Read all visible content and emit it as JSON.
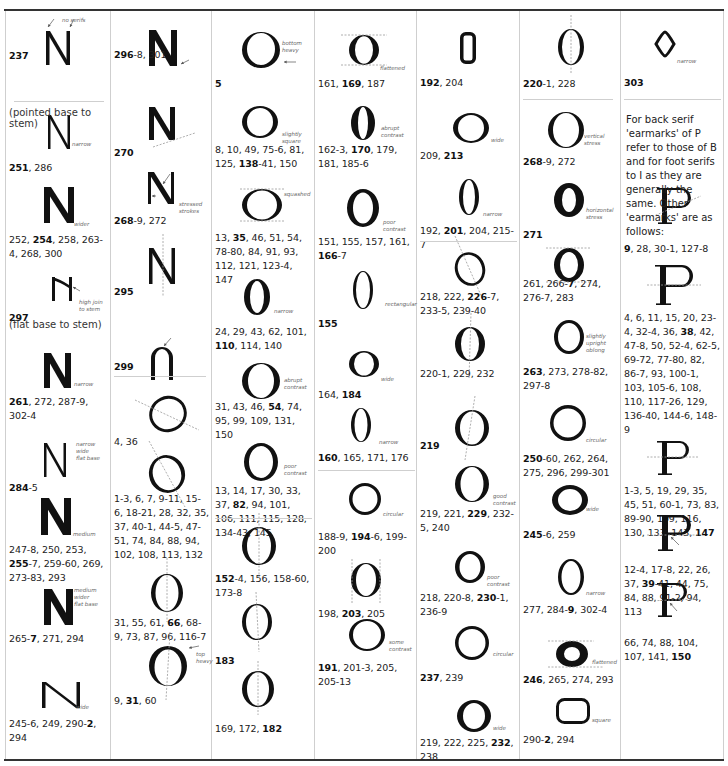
{
  "page": {
    "subheadings": {
      "pointed_base": "(pointed base to stem)",
      "flat_base": "(flat base to stem)"
    },
    "paragraph": "For back serif 'earmarks' of P refer to those of B and for foot serifs to I as they are generally the same. Other 'earmarks' are as follows:"
  },
  "columns": [
    {
      "id": "col1",
      "letter": "N",
      "entries": [
        {
          "glyph": "N-no-serifs",
          "notes": [
            "no serifs"
          ],
          "ref": [
            {
              "b": "237"
            }
          ]
        },
        {
          "glyph": "N-narrow",
          "notes": [
            "narrow"
          ],
          "ref": [
            {
              "b": "251"
            },
            {
              "t": ", 286"
            }
          ]
        },
        {
          "glyph": "N-wider",
          "notes": [
            "wider"
          ],
          "ref": [
            {
              "t": "252, "
            },
            {
              "b": "254"
            },
            {
              "t": ", 258, 263-4, 268, 300"
            }
          ]
        },
        {
          "glyph": "N-high-join",
          "notes": [
            "high join",
            "to stem"
          ],
          "ref": [
            {
              "b": "297"
            }
          ]
        },
        {
          "glyph": "N-narrow-bold",
          "notes": [
            "narrow"
          ],
          "ref": [
            {
              "b": "261"
            },
            {
              "t": ", 272, 287-9, 302-4"
            }
          ]
        },
        {
          "glyph": "N-narrow-wide-flat",
          "notes": [
            "narrow",
            "wide",
            "flat base"
          ],
          "ref": [
            {
              "b": "284"
            },
            {
              "t": "-5"
            }
          ]
        },
        {
          "glyph": "N-medium",
          "notes": [
            "medium"
          ],
          "ref": [
            {
              "t": "247-8, 250, 253, "
            },
            {
              "b": "255"
            },
            {
              "t": "-7, 259-60, 269, 273-83, 293"
            }
          ]
        },
        {
          "glyph": "N-medium-wider-flat",
          "notes": [
            "medium",
            "wider",
            "flat base"
          ],
          "ref": [
            {
              "t": "265-"
            },
            {
              "b": "7"
            },
            {
              "t": ", 271, 294"
            }
          ]
        },
        {
          "glyph": "N-wide",
          "notes": [
            "wide"
          ],
          "ref": [
            {
              "t": "245-6, 249, 290-"
            },
            {
              "b": "2"
            },
            {
              "t": ", 294"
            }
          ]
        }
      ]
    },
    {
      "id": "col2",
      "letter": "N / O",
      "entries": [
        {
          "glyph": "N-heavy-arrow",
          "notes": [],
          "ref": [
            {
              "b": "296"
            },
            {
              "t": "-8, 301"
            }
          ]
        },
        {
          "glyph": "N-base-line",
          "notes": [],
          "ref": [
            {
              "b": "270"
            }
          ]
        },
        {
          "glyph": "N-stressed",
          "notes": [
            "stressed",
            "strokes"
          ],
          "ref": [
            {
              "b": "268"
            },
            {
              "t": "-9, 272"
            }
          ]
        },
        {
          "glyph": "N-axis",
          "notes": [],
          "ref": [
            {
              "b": "295"
            }
          ]
        },
        {
          "glyph": "N-arch",
          "notes": [],
          "ref": [
            {
              "b": "299"
            }
          ]
        },
        {
          "glyph": "O-tilted",
          "notes": [],
          "ref": [
            {
              "t": "4, 36"
            }
          ]
        },
        {
          "glyph": "O-tilted-2",
          "notes": [],
          "ref": [
            {
              "t": "1-3, 6, 7, 9-11, 15-6, 18-21, 28, 32, 35, 37, 40-1, 44-5, 47-51, 74, 84, 88, 94, 102, 108, 113, 132"
            }
          ]
        },
        {
          "glyph": "O-upright",
          "notes": [],
          "ref": [
            {
              "t": "31, 55, 61, "
            },
            {
              "b": "66"
            },
            {
              "t": ", 68-9, 73, 87, 96, 116-7"
            }
          ]
        },
        {
          "glyph": "O-top-heavy",
          "notes": [
            "top heavy"
          ],
          "ref": [
            {
              "t": "9, "
            },
            {
              "b": "31"
            },
            {
              "t": ", 60"
            }
          ]
        }
      ]
    },
    {
      "id": "col3",
      "letter": "O",
      "entries": [
        {
          "glyph": "O-bottom-heavy",
          "notes": [
            "bottom",
            "heavy"
          ],
          "ref": [
            {
              "b": "5"
            }
          ]
        },
        {
          "glyph": "O-slightly-square",
          "notes": [
            "slightly",
            "square"
          ],
          "ref": [
            {
              "t": "8, 10, 49, 75-6, 81, 125, "
            },
            {
              "b": "138"
            },
            {
              "t": "-41, 150"
            }
          ]
        },
        {
          "glyph": "O-squashed",
          "notes": [
            "squashed"
          ],
          "ref": [
            {
              "t": "13, "
            },
            {
              "b": "35"
            },
            {
              "t": ", 46, 51, 54, 78-80, 84, 91, 93, 112, 121, 123-4, 147"
            }
          ]
        },
        {
          "glyph": "O-narrow",
          "notes": [
            "narrow"
          ],
          "ref": [
            {
              "t": "24, 29, 43, 62, 101, "
            },
            {
              "b": "110"
            },
            {
              "t": ", 114, 140"
            }
          ]
        },
        {
          "glyph": "O-abrupt",
          "notes": [
            "abrupt",
            "contrast"
          ],
          "ref": [
            {
              "t": "31, 43, 46, "
            },
            {
              "b": "54"
            },
            {
              "t": ", 74, 95, 99, 109, 131, 150"
            }
          ]
        },
        {
          "glyph": "O-poor",
          "notes": [
            "poor",
            "contrast"
          ],
          "ref": [
            {
              "t": "13, 14, 17, 30, 33, 37, "
            },
            {
              "b": "82"
            },
            {
              "t": ", 94, 101, 106, 111, 115, 128, 134-43, 145"
            }
          ]
        },
        {
          "glyph": "O-vert-axis",
          "notes": [],
          "ref": [
            {
              "b": "152"
            },
            {
              "t": "-4, 156, 158-60, 173-8"
            }
          ]
        },
        {
          "glyph": "O-vert-axis-2",
          "notes": [],
          "ref": [
            {
              "b": "183"
            }
          ]
        },
        {
          "glyph": "O-vert-axis-3",
          "notes": [],
          "ref": [
            {
              "t": "169, 172, "
            },
            {
              "b": "182"
            }
          ]
        }
      ]
    },
    {
      "id": "col4",
      "letter": "O",
      "entries": [
        {
          "glyph": "O-flattened",
          "notes": [
            "flattened"
          ],
          "ref": [
            {
              "t": "161, "
            },
            {
              "b": "169"
            },
            {
              "t": ", 187"
            }
          ]
        },
        {
          "glyph": "O-abrupt-narrow",
          "notes": [
            "abrupt",
            "contrast"
          ],
          "ref": [
            {
              "t": "162-3, "
            },
            {
              "b": "170"
            },
            {
              "t": ", 179, 181, 185-6"
            }
          ]
        },
        {
          "glyph": "O-poor-2",
          "notes": [
            "poor",
            "contrast"
          ],
          "ref": [
            {
              "t": "151, 155, 157, 161, "
            },
            {
              "b": "166"
            },
            {
              "t": "-7"
            }
          ]
        },
        {
          "glyph": "O-rectangular",
          "notes": [
            "rectangular"
          ],
          "ref": [
            {
              "b": "155"
            }
          ]
        },
        {
          "glyph": "O-wide-small",
          "notes": [
            "wide"
          ],
          "ref": [
            {
              "t": "164, "
            },
            {
              "b": "184"
            }
          ]
        },
        {
          "glyph": "O-narrow-thin",
          "notes": [
            "narrow"
          ],
          "ref": [
            {
              "b": "160"
            },
            {
              "t": ", 165, 171, 176"
            }
          ]
        },
        {
          "glyph": "O-circular",
          "notes": [
            "circular"
          ],
          "ref": [
            {
              "t": "188-9, "
            },
            {
              "b": "194"
            },
            {
              "t": "-6, 199-200"
            }
          ]
        },
        {
          "glyph": "O-vert-sides",
          "notes": [],
          "ref": [
            {
              "t": "198, "
            },
            {
              "b": "203"
            },
            {
              "t": ", 205"
            }
          ]
        },
        {
          "glyph": "O-some",
          "notes": [
            "some",
            "contrast"
          ],
          "ref": [
            {
              "b": "191"
            },
            {
              "t": ", 201-3, 205, 205-13"
            }
          ]
        }
      ]
    },
    {
      "id": "col5",
      "letter": "O",
      "entries": [
        {
          "glyph": "O-rect-small",
          "notes": [],
          "ref": [
            {
              "b": "192"
            },
            {
              "t": ", 204"
            }
          ]
        },
        {
          "glyph": "O-wide-5",
          "notes": [
            "wide"
          ],
          "ref": [
            {
              "t": "209, "
            },
            {
              "b": "213"
            }
          ]
        },
        {
          "glyph": "O-narrow-5",
          "notes": [
            "narrow"
          ],
          "ref": [
            {
              "t": "192, "
            },
            {
              "b": "201"
            },
            {
              "t": ", 204, 215-7"
            }
          ]
        },
        {
          "glyph": "O-tilt-5",
          "notes": [],
          "ref": [
            {
              "t": "218, 222, "
            },
            {
              "b": "226"
            },
            {
              "t": "-7, 233-5, 239-40"
            }
          ]
        },
        {
          "glyph": "O-vert-5",
          "notes": [],
          "ref": [
            {
              "t": "220-1, 229, 232"
            }
          ]
        },
        {
          "glyph": "O-tilt-axis-5",
          "notes": [],
          "ref": [
            {
              "b": "219"
            }
          ]
        },
        {
          "glyph": "O-good",
          "notes": [
            "good",
            "contrast"
          ],
          "ref": [
            {
              "t": "219, 221, "
            },
            {
              "b": "229"
            },
            {
              "t": ", 232-5, 240"
            }
          ]
        },
        {
          "glyph": "O-poor-5",
          "notes": [
            "poor",
            "contrast"
          ],
          "ref": [
            {
              "t": "218, 220-8, "
            },
            {
              "b": "230"
            },
            {
              "t": "-1, 236-9"
            }
          ]
        },
        {
          "glyph": "O-circular-5",
          "notes": [
            "circular"
          ],
          "ref": [
            {
              "b": "237"
            },
            {
              "t": ", 239"
            }
          ]
        },
        {
          "glyph": "O-wide-bold-5",
          "notes": [
            "wide"
          ],
          "ref": [
            {
              "t": "219, 222, 225, "
            },
            {
              "b": "232"
            },
            {
              "t": ", 238"
            }
          ]
        }
      ]
    },
    {
      "id": "col6",
      "letter": "O",
      "entries": [
        {
          "glyph": "O-axis-6",
          "notes": [],
          "ref": [
            {
              "b": "220"
            },
            {
              "t": "-1, 228"
            }
          ]
        },
        {
          "glyph": "O-vertical-stress",
          "notes": [
            "vertical",
            "stress"
          ],
          "ref": [
            {
              "b": "268"
            },
            {
              "t": "-9, 272"
            }
          ]
        },
        {
          "glyph": "O-horizontal-stress",
          "notes": [
            "horizontal",
            "stress"
          ],
          "ref": [
            {
              "b": "271"
            }
          ]
        },
        {
          "glyph": "O-flat-top-6",
          "notes": [],
          "ref": [
            {
              "t": "261, 266-"
            },
            {
              "b": "7"
            },
            {
              "t": ", 274, 276-7, 283"
            }
          ]
        },
        {
          "glyph": "O-oblong",
          "notes": [
            "slightly",
            "upright",
            "oblong"
          ],
          "ref": [
            {
              "b": "263"
            },
            {
              "t": ", 273, 278-82, 297-8"
            }
          ]
        },
        {
          "glyph": "O-circular-6",
          "notes": [
            "circular"
          ],
          "ref": [
            {
              "b": "250"
            },
            {
              "t": "-60, 262, 264, 275, 296, 299-301"
            }
          ]
        },
        {
          "glyph": "O-wide-6",
          "notes": [
            "wide"
          ],
          "ref": [
            {
              "b": "245"
            },
            {
              "t": "-6, 259"
            }
          ]
        },
        {
          "glyph": "O-narrow-6",
          "notes": [
            "narrow"
          ],
          "ref": [
            {
              "t": "277, 284-"
            },
            {
              "b": "9"
            },
            {
              "t": ", 302-4"
            }
          ]
        },
        {
          "glyph": "O-flattened-6",
          "notes": [
            "flattened"
          ],
          "ref": [
            {
              "b": "246"
            },
            {
              "t": ", 265, 274, 293"
            }
          ]
        },
        {
          "glyph": "O-square",
          "notes": [
            "square"
          ],
          "ref": [
            {
              "t": "290-"
            },
            {
              "b": "2"
            },
            {
              "t": ", 294"
            }
          ]
        }
      ]
    },
    {
      "id": "col7",
      "letter": "O / P",
      "entries": [
        {
          "glyph": "O-diamond",
          "notes": [
            "narrow"
          ],
          "ref": [
            {
              "b": "303"
            }
          ]
        },
        {
          "glyph": "P-1",
          "notes": [],
          "ref": [
            {
              "b": "9"
            },
            {
              "t": ", 28, 30-1, 127-8"
            }
          ]
        },
        {
          "glyph": "P-2",
          "notes": [],
          "ref": [
            {
              "t": "4, 6, 11, 15, 20, 23-4, 32-4, 36, "
            },
            {
              "b": "38"
            },
            {
              "t": ", 42, 47-8, 50, 52-4, 62-5, 69-72, 77-80, 82, 86-7, 93, 100-1, 103, 105-6, 108, 110, 117-26, 129, 136-40, 144-6, 148-9"
            }
          ]
        },
        {
          "glyph": "P-3",
          "notes": [],
          "ref": [
            {
              "t": "1-3, 5, 19, 29, 35, 45, 51, 60-1, 73, 83, 89-90, 109, 116, 130, 133, 143, "
            },
            {
              "b": "147"
            }
          ]
        },
        {
          "glyph": "P-4",
          "notes": [],
          "ref": [
            {
              "t": "12-4, 17-8, 22, 26, 37, "
            },
            {
              "b": "39"
            },
            {
              "t": "-41, 44, 75, 84, 88, 91-2, 94, 113"
            }
          ]
        },
        {
          "glyph": "P-5",
          "notes": [],
          "ref": [
            {
              "t": "66, 74, 88, 104, 107, 141, "
            },
            {
              "b": "150"
            }
          ]
        }
      ]
    }
  ]
}
